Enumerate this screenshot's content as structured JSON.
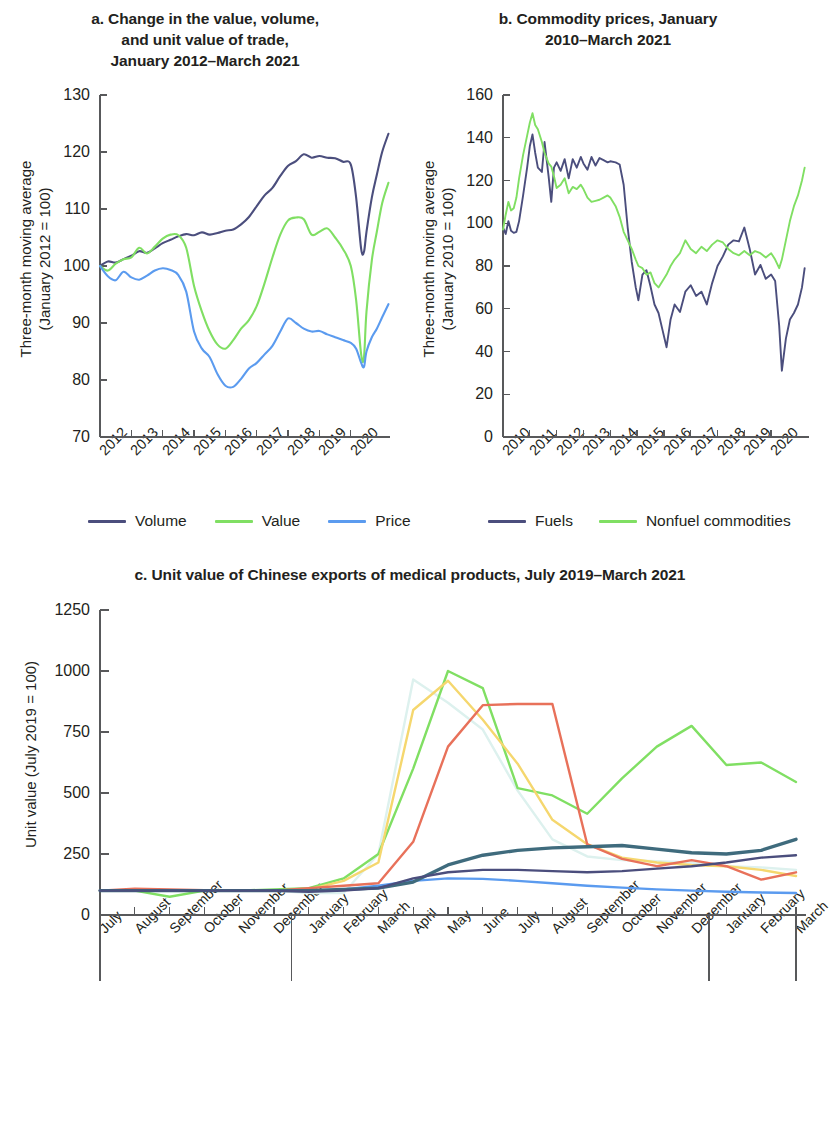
{
  "figure": {
    "background": "#ffffff",
    "text_color": "#231f20"
  },
  "panel_a": {
    "title_line1": "a. Change in the value, volume,",
    "title_line2": "and unit value of trade,",
    "title_line3": "January 2012–March 2021",
    "ylabel_line1": "Three-month moving average",
    "ylabel_line2": "(January 2012 = 100)"
  },
  "panel_b": {
    "title_line1": "b. Commodity prices, January",
    "title_line2": "2010–March 2021",
    "ylabel_line1": "Three-month moving average",
    "ylabel_line2": "(January 2010 = 100)"
  },
  "panel_c": {
    "title": "c. Unit value of Chinese exports of medical products, July 2019–March 2021",
    "ylabel": "Unit value (July 2019 = 100)",
    "year_groups": [
      "2019",
      "2020",
      "2021"
    ]
  },
  "chart_data": [
    {
      "id": "panel_a",
      "type": "line",
      "title": "a. Change in the value, volume, and unit value of trade, January 2012–March 2021",
      "xlabel": "",
      "ylabel": "Three-month moving average (January 2012 = 100)",
      "ylim": [
        70,
        130
      ],
      "yticks": [
        70,
        80,
        90,
        100,
        110,
        120,
        130
      ],
      "xlim": [
        2012,
        2021.25
      ],
      "xticks": [
        2012,
        2013,
        2014,
        2015,
        2016,
        2017,
        2018,
        2019,
        2020
      ],
      "xtick_labels": [
        "2012",
        "2013",
        "2014",
        "2015",
        "2016",
        "2017",
        "2018",
        "2019",
        "2020"
      ],
      "grid": false,
      "legend_position": "below",
      "series": [
        {
          "name": "Volume",
          "color": "#4b4e7d",
          "x": [
            2012.0,
            2012.25,
            2012.5,
            2012.75,
            2013.0,
            2013.25,
            2013.5,
            2013.75,
            2014.0,
            2014.25,
            2014.5,
            2014.75,
            2015.0,
            2015.25,
            2015.5,
            2015.75,
            2016.0,
            2016.25,
            2016.5,
            2016.75,
            2017.0,
            2017.25,
            2017.5,
            2017.75,
            2018.0,
            2018.25,
            2018.5,
            2018.75,
            2019.0,
            2019.25,
            2019.5,
            2019.75,
            2020.0,
            2020.17,
            2020.33,
            2020.42,
            2020.5,
            2020.67,
            2020.83,
            2021.0,
            2021.2
          ],
          "values": [
            100.0,
            100.8,
            100.6,
            101.2,
            101.8,
            102.6,
            102.3,
            103.1,
            104.0,
            104.6,
            105.2,
            105.6,
            105.4,
            105.9,
            105.5,
            105.8,
            106.2,
            106.4,
            107.3,
            108.6,
            110.5,
            112.4,
            113.7,
            115.8,
            117.6,
            118.4,
            119.6,
            119.0,
            119.3,
            119.0,
            118.9,
            118.3,
            117.8,
            112.0,
            103.0,
            102.5,
            106.0,
            112.0,
            116.0,
            120.0,
            123.2
          ]
        },
        {
          "name": "Value",
          "color": "#80df63",
          "x": [
            2012.0,
            2012.25,
            2012.5,
            2012.75,
            2013.0,
            2013.25,
            2013.5,
            2013.75,
            2014.0,
            2014.25,
            2014.5,
            2014.75,
            2015.0,
            2015.25,
            2015.5,
            2015.75,
            2016.0,
            2016.25,
            2016.5,
            2016.75,
            2017.0,
            2017.25,
            2017.5,
            2017.75,
            2018.0,
            2018.25,
            2018.5,
            2018.75,
            2019.0,
            2019.25,
            2019.5,
            2019.75,
            2020.0,
            2020.17,
            2020.33,
            2020.42,
            2020.5,
            2020.67,
            2020.83,
            2021.0,
            2021.2
          ],
          "values": [
            100.0,
            99.2,
            100.4,
            101.2,
            101.5,
            103.2,
            102.2,
            103.4,
            104.8,
            105.5,
            105.4,
            103.2,
            96.5,
            92.0,
            88.5,
            86.2,
            85.5,
            87.0,
            89.0,
            90.5,
            93.0,
            97.0,
            101.5,
            105.5,
            108.0,
            108.5,
            108.2,
            105.5,
            106.0,
            106.6,
            105.0,
            103.0,
            100.0,
            94.0,
            84.5,
            84.0,
            92.0,
            101.0,
            106.0,
            111.0,
            114.6
          ]
        },
        {
          "name": "Price",
          "color": "#5b9bef",
          "x": [
            2012.0,
            2012.25,
            2012.5,
            2012.75,
            2013.0,
            2013.25,
            2013.5,
            2013.75,
            2014.0,
            2014.25,
            2014.5,
            2014.75,
            2015.0,
            2015.25,
            2015.5,
            2015.75,
            2016.0,
            2016.25,
            2016.5,
            2016.75,
            2017.0,
            2017.25,
            2017.5,
            2017.75,
            2018.0,
            2018.25,
            2018.5,
            2018.75,
            2019.0,
            2019.25,
            2019.5,
            2019.75,
            2020.0,
            2020.17,
            2020.33,
            2020.42,
            2020.5,
            2020.67,
            2020.83,
            2021.0,
            2021.2
          ],
          "values": [
            100.0,
            98.2,
            97.5,
            99.0,
            98.0,
            97.6,
            98.3,
            99.2,
            99.6,
            99.3,
            98.4,
            95.5,
            88.5,
            85.5,
            84.0,
            81.0,
            79.0,
            78.8,
            80.2,
            82.0,
            83.0,
            84.5,
            86.0,
            88.5,
            90.8,
            90.0,
            89.0,
            88.5,
            88.6,
            88.0,
            87.5,
            87.0,
            86.5,
            85.5,
            83.0,
            82.3,
            85.0,
            87.5,
            89.0,
            91.0,
            93.3
          ]
        }
      ]
    },
    {
      "id": "panel_b",
      "type": "line",
      "title": "b. Commodity prices, January 2010–March 2021",
      "xlabel": "",
      "ylabel": "Three-month moving average (January 2010 = 100)",
      "ylim": [
        0,
        160
      ],
      "yticks": [
        0,
        20,
        40,
        60,
        80,
        100,
        120,
        140,
        160
      ],
      "xlim": [
        2010,
        2021.3
      ],
      "xticks": [
        2010,
        2011,
        2012,
        2013,
        2014,
        2015,
        2016,
        2017,
        2018,
        2019,
        2020
      ],
      "xtick_labels": [
        "2010",
        "2011",
        "2012",
        "2013",
        "2014",
        "2015",
        "2016",
        "2017",
        "2018",
        "2019",
        "2020"
      ],
      "grid": false,
      "legend_position": "below",
      "series": [
        {
          "name": "Fuels",
          "color": "#4b4e7d",
          "x": [
            2010.0,
            2010.1,
            2010.2,
            2010.3,
            2010.4,
            2010.5,
            2010.6,
            2010.75,
            2010.9,
            2011.0,
            2011.1,
            2011.2,
            2011.3,
            2011.45,
            2011.55,
            2011.7,
            2011.8,
            2011.9,
            2012.0,
            2012.15,
            2012.3,
            2012.45,
            2012.6,
            2012.75,
            2012.9,
            2013.0,
            2013.15,
            2013.3,
            2013.45,
            2013.6,
            2013.75,
            2013.9,
            2014.0,
            2014.2,
            2014.35,
            2014.5,
            2014.65,
            2014.8,
            2014.95,
            2015.05,
            2015.2,
            2015.35,
            2015.5,
            2015.65,
            2015.8,
            2015.95,
            2016.1,
            2016.25,
            2016.4,
            2016.6,
            2016.8,
            2017.0,
            2017.2,
            2017.4,
            2017.6,
            2017.8,
            2018.0,
            2018.2,
            2018.4,
            2018.6,
            2018.8,
            2019.0,
            2019.2,
            2019.4,
            2019.6,
            2019.8,
            2020.0,
            2020.15,
            2020.3,
            2020.4,
            2020.55,
            2020.7,
            2020.85,
            2021.0,
            2021.15,
            2021.25
          ],
          "values": [
            98.0,
            95.0,
            101.0,
            96.5,
            95.5,
            96.0,
            101.0,
            113.0,
            126.0,
            136.0,
            141.5,
            133.0,
            126.0,
            124.0,
            138.0,
            122.0,
            110.0,
            126.0,
            128.5,
            124.5,
            130.0,
            121.0,
            130.0,
            126.0,
            131.0,
            128.0,
            125.0,
            131.0,
            127.0,
            130.5,
            129.5,
            128.5,
            129.0,
            128.5,
            127.5,
            118.0,
            98.0,
            82.0,
            70.0,
            64.0,
            76.0,
            78.0,
            70.5,
            62.0,
            58.0,
            50.0,
            42.0,
            55.0,
            62.0,
            58.5,
            68.0,
            71.0,
            66.0,
            68.0,
            62.0,
            72.0,
            80.0,
            84.5,
            90.0,
            92.0,
            91.5,
            98.0,
            88.0,
            76.0,
            80.5,
            74.0,
            76.0,
            73.0,
            52.0,
            31.0,
            46.0,
            55.0,
            58.0,
            62.0,
            70.0,
            79.0
          ]
        },
        {
          "name": "Nonfuel commodities",
          "color": "#80df63",
          "x": [
            2010.0,
            2010.1,
            2010.2,
            2010.3,
            2010.4,
            2010.5,
            2010.6,
            2010.75,
            2010.9,
            2011.0,
            2011.1,
            2011.2,
            2011.3,
            2011.45,
            2011.55,
            2011.7,
            2011.8,
            2011.9,
            2012.0,
            2012.15,
            2012.3,
            2012.45,
            2012.6,
            2012.75,
            2012.9,
            2013.0,
            2013.15,
            2013.3,
            2013.45,
            2013.6,
            2013.75,
            2013.9,
            2014.0,
            2014.2,
            2014.35,
            2014.5,
            2014.65,
            2014.8,
            2014.95,
            2015.05,
            2015.2,
            2015.35,
            2015.5,
            2015.65,
            2015.8,
            2015.95,
            2016.1,
            2016.25,
            2016.4,
            2016.6,
            2016.8,
            2017.0,
            2017.2,
            2017.4,
            2017.6,
            2017.8,
            2018.0,
            2018.2,
            2018.4,
            2018.6,
            2018.8,
            2019.0,
            2019.2,
            2019.4,
            2019.6,
            2019.8,
            2020.0,
            2020.15,
            2020.3,
            2020.4,
            2020.55,
            2020.7,
            2020.85,
            2021.0,
            2021.15,
            2021.25
          ],
          "values": [
            97.0,
            104.0,
            110.0,
            106.0,
            107.0,
            112.0,
            121.0,
            132.0,
            141.0,
            147.0,
            151.5,
            146.0,
            144.0,
            138.0,
            133.0,
            128.0,
            126.5,
            122.0,
            116.5,
            118.0,
            121.0,
            114.0,
            117.0,
            116.0,
            118.0,
            116.0,
            112.0,
            110.0,
            110.5,
            111.0,
            112.0,
            113.0,
            112.0,
            108.0,
            103.0,
            96.0,
            92.0,
            88.0,
            83.0,
            80.0,
            79.0,
            76.0,
            77.0,
            72.0,
            70.0,
            73.0,
            76.0,
            80.0,
            83.0,
            86.0,
            92.0,
            88.0,
            86.0,
            89.0,
            87.0,
            90.0,
            92.0,
            91.0,
            88.0,
            86.0,
            85.0,
            87.0,
            85.0,
            87.0,
            86.0,
            84.0,
            86.0,
            83.0,
            79.0,
            83.0,
            92.0,
            101.0,
            108.0,
            113.0,
            120.0,
            126.0
          ]
        }
      ]
    },
    {
      "id": "panel_c",
      "type": "line",
      "title": "c. Unit value of Chinese exports of medical products, July 2019–March 2021",
      "xlabel": "",
      "ylabel": "Unit value (July 2019 = 100)",
      "ylim": [
        0,
        1250
      ],
      "yticks": [
        0,
        250,
        500,
        750,
        1000,
        1250
      ],
      "grid": false,
      "legend_position": "below",
      "categories": [
        "July",
        "August",
        "September",
        "October",
        "November",
        "December",
        "January",
        "February",
        "March",
        "April",
        "May",
        "June",
        "July",
        "August",
        "September",
        "October",
        "November",
        "December",
        "January",
        "February",
        "March"
      ],
      "series": [
        {
          "name": "Viral transport medium",
          "color": "#4b4e7d",
          "values": [
            100,
            100,
            100,
            100,
            100,
            100,
            95,
            100,
            110,
            150,
            175,
            185,
            185,
            180,
            175,
            180,
            190,
            200,
            215,
            235,
            245
          ]
        },
        {
          "name": "Medical masks",
          "color": "#f5d76e",
          "values": [
            100,
            100,
            100,
            100,
            100,
            100,
            105,
            140,
            215,
            840,
            960,
            800,
            620,
            390,
            290,
            235,
            215,
            205,
            200,
            185,
            160
          ]
        },
        {
          "name": "Nitrile and sterile gloves",
          "color": "#3f6b7d",
          "values": [
            100,
            100,
            100,
            100,
            100,
            100,
            100,
            105,
            110,
            135,
            205,
            245,
            265,
            275,
            280,
            285,
            270,
            255,
            250,
            265,
            310
          ]
        },
        {
          "name": "Medical test kits",
          "color": "#80df63",
          "values": [
            100,
            100,
            75,
            100,
            100,
            105,
            110,
            150,
            250,
            600,
            1000,
            930,
            520,
            490,
            415,
            560,
            690,
            775,
            615,
            625,
            545
          ]
        },
        {
          "name": "Protective clothing",
          "color": "#ddf1ee",
          "values": [
            100,
            100,
            100,
            100,
            100,
            100,
            90,
            90,
            250,
            965,
            870,
            760,
            510,
            310,
            240,
            225,
            220,
            215,
            200,
            195,
            185
          ]
        },
        {
          "name": "Disinfectant",
          "color": "#5b9bef",
          "values": [
            100,
            100,
            100,
            100,
            100,
            100,
            100,
            105,
            120,
            140,
            150,
            148,
            140,
            130,
            120,
            112,
            105,
            100,
            95,
            92,
            90
          ]
        },
        {
          "name": "Ventilators, oxygen masks",
          "color": "#e8715a",
          "values": [
            100,
            108,
            105,
            102,
            100,
            100,
            110,
            120,
            130,
            300,
            690,
            860,
            865,
            865,
            290,
            230,
            200,
            225,
            200,
            145,
            175
          ]
        }
      ]
    }
  ],
  "legend_a": [
    {
      "label": "Volume",
      "color": "#4b4e7d"
    },
    {
      "label": "Value",
      "color": "#80df63"
    },
    {
      "label": "Price",
      "color": "#5b9bef"
    }
  ],
  "legend_b": [
    {
      "label": "Fuels",
      "color": "#4b4e7d"
    },
    {
      "label": "Nonfuel commodities",
      "color": "#80df63"
    }
  ],
  "legend_c": [
    {
      "label": "Viral transport medium",
      "color": "#4b4e7d"
    },
    {
      "label": "Medical test kits",
      "color": "#80df63"
    },
    {
      "label": "Disinfectant",
      "color": "#5b9bef"
    },
    {
      "label": "Medical masks",
      "color": "#f5d76e"
    },
    {
      "label": "Protective clothing",
      "color": "#ddf1ee"
    },
    {
      "label": "Ventilators, oxygen masks",
      "color": "#e8715a"
    },
    {
      "label": "Nitrile and sterile gloves",
      "color": "#3f6b7d"
    }
  ]
}
